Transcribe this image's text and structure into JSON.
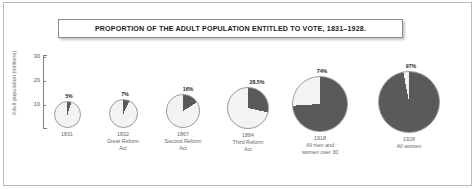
{
  "chart_data": {
    "type": "pie",
    "title": "PROPORTION OF THE ADULT POPULATION ENTITLED TO VOTE, 1831–1928.",
    "ylabel": "Adult population (millions)",
    "ylim": [
      0,
      30
    ],
    "yticks": [
      "10",
      "20",
      "30"
    ],
    "grid": false,
    "legend": "none",
    "value_label": "% entitled to vote",
    "series_note": "Pie diameter encodes total adult population; dark slice encodes proportion entitled to vote.",
    "categories": [
      "1831",
      "1832",
      "1867",
      "1884",
      "1918",
      "1928"
    ],
    "values": [
      5,
      7,
      16,
      28.5,
      74,
      97
    ],
    "value_labels": [
      "5%",
      "7%",
      "16%",
      "28.5%",
      "74%",
      "97%"
    ],
    "slices": [
      {
        "year": "1831",
        "subtitle": "",
        "entitled_pct": 5,
        "label": "5%",
        "colors": {
          "entitled": "#5a5a5a",
          "not_entitled": "#f3f3f3"
        }
      },
      {
        "year": "1832",
        "subtitle": "Great Reform Act",
        "entitled_pct": 7,
        "label": "7%",
        "colors": {
          "entitled": "#5a5a5a",
          "not_entitled": "#f3f3f3"
        }
      },
      {
        "year": "1867",
        "subtitle": "Second Reform Act",
        "entitled_pct": 16,
        "label": "16%",
        "colors": {
          "entitled": "#5a5a5a",
          "not_entitled": "#f3f3f3"
        }
      },
      {
        "year": "1884",
        "subtitle": "Third Reform Act",
        "entitled_pct": 28.5,
        "label": "28.5%",
        "colors": {
          "entitled": "#5a5a5a",
          "not_entitled": "#f3f3f3"
        }
      },
      {
        "year": "1918",
        "subtitle": "All men and women over 30",
        "entitled_pct": 74,
        "label": "74%",
        "colors": {
          "entitled": "#5a5a5a",
          "not_entitled": "#f5f5f5"
        }
      },
      {
        "year": "1928",
        "subtitle": "All women",
        "entitled_pct": 97,
        "label": "97%",
        "colors": {
          "entitled": "#5a5a5a",
          "not_entitled": "#f5f5f5"
        }
      }
    ]
  },
  "axis": {
    "label": "Adult population (millions)",
    "ticks": [
      {
        "value": "30"
      },
      {
        "value": "20"
      },
      {
        "value": "10"
      }
    ]
  },
  "title": {
    "text": "PROPORTION OF THE ADULT POPULATION ENTITLED TO VOTE, 1831–1928."
  },
  "pies": [
    {
      "year": "1831",
      "line1": "1831",
      "line2": "",
      "line3": "",
      "pct": "5%",
      "pct_value": 5,
      "cx": 67,
      "cy": 114,
      "r": 13.5
    },
    {
      "year": "1832",
      "line1": "1832",
      "line2": "Great Reform",
      "line3": "Act",
      "pct": "7%",
      "pct_value": 7,
      "cx": 123,
      "cy": 113,
      "r": 14.5
    },
    {
      "year": "1867",
      "line1": "1867",
      "line2": "Second Reform",
      "line3": "Act",
      "pct": "16%",
      "pct_value": 16,
      "cx": 183,
      "cy": 111,
      "r": 17
    },
    {
      "year": "1884",
      "line1": "1884",
      "line2": "Third Reform",
      "line3": "Act",
      "pct": "28.5%",
      "pct_value": 28.5,
      "cx": 248,
      "cy": 108,
      "r": 21
    },
    {
      "year": "1918",
      "line1": "1918",
      "line2": "All men and",
      "line3": "women over 30",
      "pct": "74%",
      "pct_value": 74,
      "cx": 320,
      "cy": 104,
      "r": 28
    },
    {
      "year": "1928",
      "line1": "1928",
      "line2": "All women",
      "line3": "",
      "pct": "97%",
      "pct_value": 97,
      "cx": 409,
      "cy": 102,
      "r": 31
    }
  ],
  "colors": {
    "entitled": "#5a5a5a",
    "not_entitled": "#f3f3f3",
    "pie_outline": "#9a9a9a",
    "axis": "#808080",
    "frame": "#b9b9b9",
    "title_text": "#1c1c1c",
    "caption_text": "#676767"
  }
}
